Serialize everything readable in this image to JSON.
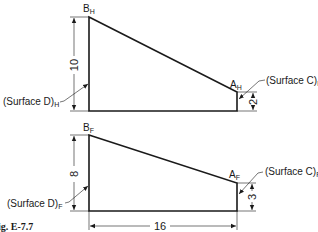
{
  "figure": {
    "caption": "ig. E-7.7"
  },
  "top_view": {
    "name": "H",
    "point_b": "B",
    "point_b_sub": "H",
    "point_a": "A",
    "point_a_sub": "H",
    "surface_d_label": "(Surface D)",
    "surface_d_sub": "H",
    "surface_c_label": "(Surface C)",
    "surface_c_sub": "H",
    "left_height_dim": "10",
    "right_height_dim": "2"
  },
  "bottom_view": {
    "name": "F",
    "point_b": "B",
    "point_b_sub": "F",
    "point_a": "A",
    "point_a_sub": "F",
    "surface_d_label": "(Surface D)",
    "surface_d_sub": "F",
    "surface_c_label": "(Surface C)",
    "surface_c_sub": "F",
    "left_height_dim": "8",
    "right_height_dim": "3",
    "width_dim": "16"
  },
  "colors": {
    "line": "#1a1a1a",
    "background": "#ffffff"
  }
}
